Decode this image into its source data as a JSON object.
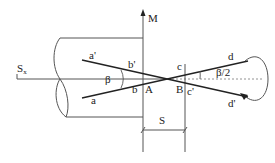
{
  "diagram": {
    "labels": {
      "M": "M",
      "Sx": "S",
      "Sx_sub": "x",
      "beta": "β",
      "beta_half": "β/2",
      "a": "a",
      "a_prime": "a'",
      "b": "b",
      "b_prime": "b'",
      "A": "A",
      "B": "B",
      "c": "c",
      "c_prime": "c'",
      "d": "d",
      "d_prime": "d'",
      "S": "S"
    },
    "colors": {
      "line": "#444444",
      "text": "#222222",
      "background": "#ffffff"
    }
  }
}
